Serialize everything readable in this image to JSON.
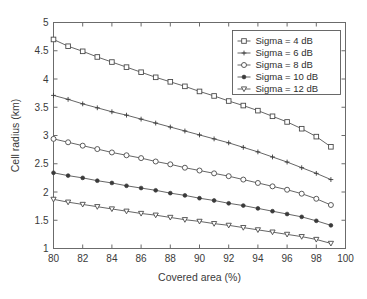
{
  "chart_data": {
    "type": "line",
    "title": "",
    "xlabel": "Covered area (%)",
    "ylabel": "Cell radius (km)",
    "xlim": [
      80,
      100
    ],
    "ylim": [
      1,
      5
    ],
    "xticks": [
      80,
      82,
      84,
      86,
      88,
      90,
      92,
      94,
      96,
      98,
      100
    ],
    "xtick_labels": [
      "80",
      "82",
      "84",
      "86",
      "88",
      "90",
      "92",
      "94",
      "96",
      "98",
      "100"
    ],
    "yticks": [
      1,
      1.5,
      2,
      2.5,
      3,
      3.5,
      4,
      4.5,
      5
    ],
    "ytick_labels": [
      "1",
      "1.5",
      "2",
      "2.5",
      "3",
      "3.5",
      "4",
      "4.5",
      "5"
    ],
    "grid": false,
    "legend_position": "upper right",
    "x": [
      80,
      81,
      82,
      83,
      84,
      85,
      86,
      87,
      88,
      89,
      90,
      91,
      92,
      93,
      94,
      95,
      96,
      97,
      98,
      99
    ],
    "series": [
      {
        "name": "Sigma =  4 dB",
        "marker": "square-open",
        "values": [
          4.7,
          4.58,
          4.49,
          4.39,
          4.3,
          4.21,
          4.12,
          4.03,
          3.95,
          3.87,
          3.78,
          3.7,
          3.61,
          3.53,
          3.44,
          3.34,
          3.24,
          3.12,
          2.98,
          2.8
        ]
      },
      {
        "name": "Sigma =  6 dB",
        "marker": "plus",
        "values": [
          3.71,
          3.64,
          3.56,
          3.49,
          3.42,
          3.36,
          3.29,
          3.22,
          3.15,
          3.08,
          3.01,
          2.94,
          2.87,
          2.79,
          2.71,
          2.62,
          2.53,
          2.43,
          2.33,
          2.22
        ]
      },
      {
        "name": "Sigma =  8 dB",
        "marker": "circle-open",
        "values": [
          2.94,
          2.88,
          2.82,
          2.76,
          2.7,
          2.65,
          2.6,
          2.54,
          2.49,
          2.43,
          2.38,
          2.33,
          2.28,
          2.22,
          2.16,
          2.1,
          2.04,
          1.97,
          1.88,
          1.77
        ]
      },
      {
        "name": "Sigma = 10 dB",
        "marker": "dot-filled",
        "values": [
          2.34,
          2.29,
          2.25,
          2.2,
          2.16,
          2.11,
          2.07,
          2.03,
          1.98,
          1.94,
          1.89,
          1.85,
          1.8,
          1.76,
          1.71,
          1.66,
          1.61,
          1.56,
          1.49,
          1.41
        ]
      },
      {
        "name": "Sigma = 12 dB",
        "marker": "triangle-down",
        "values": [
          1.87,
          1.82,
          1.78,
          1.74,
          1.7,
          1.66,
          1.62,
          1.59,
          1.55,
          1.51,
          1.48,
          1.44,
          1.41,
          1.37,
          1.33,
          1.29,
          1.25,
          1.21,
          1.16,
          1.09
        ]
      }
    ]
  },
  "legend": {
    "entries": [
      {
        "label": "Sigma =  4 dB"
      },
      {
        "label": "Sigma =  6 dB"
      },
      {
        "label": "Sigma =  8 dB"
      },
      {
        "label": "Sigma = 10 dB"
      },
      {
        "label": "Sigma = 12 dB"
      }
    ]
  },
  "colors": {
    "axis": "#6b6b6b",
    "line": "#555555",
    "marker_fill": "#ffffff",
    "marker_stroke": "#4a4a4a",
    "text": "#3a3a3a",
    "background": "#ffffff"
  }
}
